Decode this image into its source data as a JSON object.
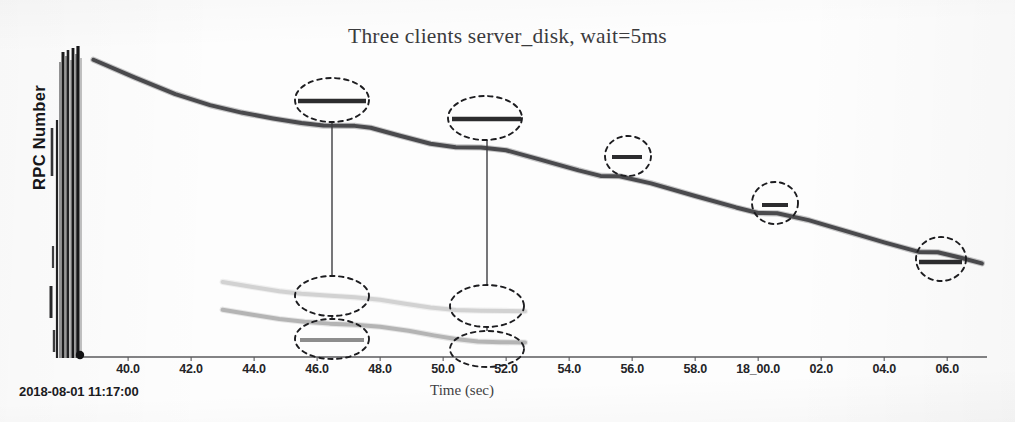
{
  "chart_data": {
    "type": "line",
    "title": "Three clients server_disk, wait=5ms",
    "xlabel": "Time (sec)",
    "ylabel": "RPC Number",
    "timestamp": "2018-08-01 11:17:00",
    "grid": false,
    "legend": "none",
    "xlim": [
      38.6,
      67.2
    ],
    "xtick_labels": [
      "40.0",
      "42.0",
      "44.0",
      "46.0",
      "48.0",
      "50.0",
      "52.0",
      "54.0",
      "56.0",
      "58.0",
      "18_00.0",
      "02.0",
      "04.0",
      "06.0"
    ],
    "xtick_values": [
      40.0,
      42.0,
      44.0,
      46.0,
      48.0,
      50.0,
      52.0,
      54.0,
      56.0,
      58.0,
      60.0,
      62.0,
      64.0,
      66.0
    ],
    "ytick_labels": [],
    "series": [
      {
        "name": "client-1",
        "color": "#4a4a4d",
        "width": 4.0,
        "x": [
          38.9,
          40.2,
          41.5,
          42.6,
          43.6,
          44.6,
          45.5,
          46.2,
          47.2,
          47.7,
          48.6,
          49.6,
          50.4,
          51.2,
          52.0,
          53.0,
          54.3,
          55.0,
          55.6,
          56.6,
          58.0,
          59.3,
          60.0,
          60.6,
          61.6,
          62.9,
          64.0,
          65.1,
          65.7,
          66.4,
          67.1
        ],
        "y": [
          0.962,
          0.905,
          0.851,
          0.815,
          0.791,
          0.772,
          0.757,
          0.749,
          0.748,
          0.742,
          0.717,
          0.69,
          0.679,
          0.678,
          0.669,
          0.641,
          0.604,
          0.586,
          0.585,
          0.562,
          0.521,
          0.484,
          0.466,
          0.465,
          0.443,
          0.404,
          0.371,
          0.34,
          0.339,
          0.322,
          0.303
        ]
      },
      {
        "name": "client-2",
        "color": "#d2d2d2",
        "width": 4.0,
        "x": [
          43.0,
          44.0,
          44.8,
          45.5,
          46.3,
          47.2,
          48.0,
          48.8,
          49.6,
          50.4,
          51.2,
          52.0,
          52.6
        ],
        "y": [
          0.243,
          0.226,
          0.213,
          0.205,
          0.199,
          0.193,
          0.185,
          0.172,
          0.16,
          0.152,
          0.15,
          0.149,
          0.148
        ]
      },
      {
        "name": "client-3",
        "color": "#b4b4b4",
        "width": 4.0,
        "x": [
          43.0,
          44.0,
          44.8,
          45.6,
          46.4,
          47.2,
          48.0,
          48.9,
          49.7,
          50.4,
          51.1,
          51.8,
          52.6
        ],
        "y": [
          0.153,
          0.136,
          0.123,
          0.114,
          0.108,
          0.104,
          0.098,
          0.085,
          0.07,
          0.058,
          0.05,
          0.048,
          0.047
        ]
      }
    ],
    "annotations": [
      {
        "name": "plateau-1-upper",
        "shape": "dashed-ellipse",
        "cx": 332,
        "cy": 100,
        "rx": 37,
        "ry": 22,
        "segment": {
          "x1": 298,
          "y1": 101,
          "x2": 366,
          "y2": 101,
          "color": "#2c2c2e",
          "width": 4.5
        }
      },
      {
        "name": "plateau-2-upper",
        "shape": "dashed-ellipse",
        "cx": 485,
        "cy": 118,
        "rx": 37,
        "ry": 22,
        "segment": {
          "x1": 452,
          "y1": 119,
          "x2": 521,
          "y2": 119,
          "color": "#2c2c2e",
          "width": 4.5
        }
      },
      {
        "name": "plateau-3-upper",
        "shape": "dashed-ellipse",
        "cx": 628,
        "cy": 156,
        "rx": 23,
        "ry": 20,
        "segment": {
          "x1": 612,
          "y1": 157,
          "x2": 642,
          "y2": 157,
          "color": "#2c2c2e",
          "width": 4.0
        }
      },
      {
        "name": "plateau-4-upper",
        "shape": "dashed-ellipse",
        "cx": 775,
        "cy": 203,
        "rx": 23,
        "ry": 21,
        "segment": {
          "x1": 762,
          "y1": 205,
          "x2": 788,
          "y2": 205,
          "color": "#2c2c2e",
          "width": 4.0
        }
      },
      {
        "name": "plateau-5-upper",
        "shape": "dashed-ellipse",
        "cx": 941,
        "cy": 259,
        "rx": 25,
        "ry": 22,
        "segment": {
          "x1": 919,
          "y1": 262,
          "x2": 962,
          "y2": 262,
          "color": "#2c2c2e",
          "width": 4.5
        }
      },
      {
        "name": "plateau-1-mid",
        "shape": "dashed-ellipse",
        "cx": 332,
        "cy": 296,
        "rx": 37,
        "ry": 20,
        "segment": null
      },
      {
        "name": "plateau-1-low",
        "shape": "dashed-ellipse",
        "cx": 332,
        "cy": 339,
        "rx": 37,
        "ry": 20,
        "segment": {
          "x1": 300,
          "y1": 340,
          "x2": 364,
          "y2": 340,
          "color": "#8d8d8d",
          "width": 4.0
        }
      },
      {
        "name": "plateau-2-mid",
        "shape": "dashed-ellipse",
        "cx": 487,
        "cy": 306,
        "rx": 37,
        "ry": 21,
        "segment": null
      },
      {
        "name": "plateau-2-low",
        "shape": "dashed-ellipse",
        "cx": 487,
        "cy": 349,
        "rx": 37,
        "ry": 18,
        "segment": null
      }
    ],
    "connectors": [
      {
        "name": "connector-1",
        "x1": 332,
        "y1": 122,
        "x2": 332,
        "y2": 276
      },
      {
        "name": "connector-1b",
        "x1": 332,
        "y1": 316,
        "x2": 332,
        "y2": 320
      },
      {
        "name": "connector-2",
        "x1": 487,
        "y1": 140,
        "x2": 487,
        "y2": 285
      },
      {
        "name": "connector-2b",
        "x1": 487,
        "y1": 327,
        "x2": 487,
        "y2": 331
      }
    ]
  }
}
